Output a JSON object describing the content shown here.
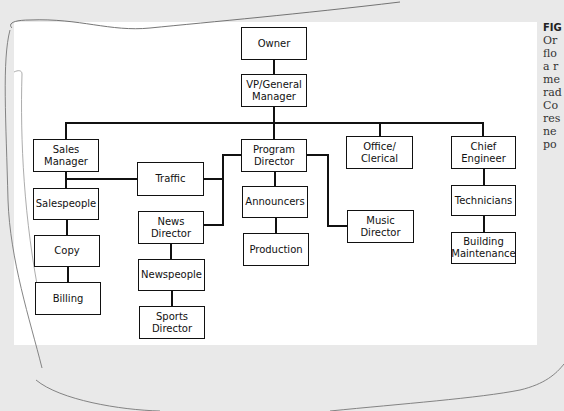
{
  "figure": {
    "caption_lines": [
      "FIG",
      "Or",
      "flo",
      "a r",
      "me",
      "rad",
      "Co",
      "res",
      "ne",
      "po"
    ]
  },
  "org_chart": {
    "nodes": {
      "owner": "Owner",
      "vp_general_manager": "VP/General\nManager",
      "sales_manager": "Sales\nManager",
      "traffic": "Traffic",
      "program_director": "Program\nDirector",
      "office_clerical": "Office/\nClerical",
      "chief_engineer": "Chief\nEngineer",
      "salespeople": "Salespeople",
      "copy": "Copy",
      "billing": "Billing",
      "news_director": "News\nDirector",
      "newspeople": "Newspeople",
      "sports_director": "Sports\nDirector",
      "announcers": "Announcers",
      "production": "Production",
      "music_director": "Music\nDirector",
      "technicians": "Technicians",
      "building_maintenance": "Building\nMaintenance"
    },
    "edges": [
      [
        "Owner",
        "VP/General Manager"
      ],
      [
        "VP/General Manager",
        "Sales Manager"
      ],
      [
        "VP/General Manager",
        "Program Director"
      ],
      [
        "VP/General Manager",
        "Office/Clerical"
      ],
      [
        "VP/General Manager",
        "Chief Engineer"
      ],
      [
        "Sales Manager",
        "Salespeople"
      ],
      [
        "Sales Manager",
        "Traffic"
      ],
      [
        "Program Director",
        "Traffic"
      ],
      [
        "Salespeople",
        "Copy"
      ],
      [
        "Copy",
        "Billing"
      ],
      [
        "Program Director",
        "News Director"
      ],
      [
        "News Director",
        "Newspeople"
      ],
      [
        "Newspeople",
        "Sports Director"
      ],
      [
        "Program Director",
        "Announcers"
      ],
      [
        "Announcers",
        "Production"
      ],
      [
        "Program Director",
        "Music Director"
      ],
      [
        "Chief Engineer",
        "Technicians"
      ],
      [
        "Technicians",
        "Building Maintenance"
      ]
    ]
  }
}
